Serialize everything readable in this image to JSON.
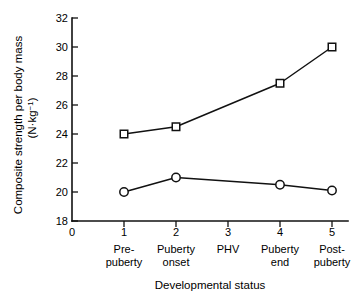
{
  "chart_data": {
    "type": "line",
    "title": "",
    "xlabel": "Developmental status",
    "ylabel": "Composite strength per body mass",
    "ylabel_units": "(N·kg",
    "ylabel_units_sup": "−1",
    "ylabel_units_close": ")",
    "x": [
      1,
      2,
      3,
      4,
      5
    ],
    "categories": [
      "Pre-\npuberty",
      "Puberty\nonset",
      "PHV",
      "Puberty\nend",
      "Post-\npuberty"
    ],
    "category_lines": [
      [
        "Pre-",
        "puberty"
      ],
      [
        "Puberty",
        "onset"
      ],
      [
        "PHV",
        ""
      ],
      [
        "Puberty",
        "end"
      ],
      [
        "Post-",
        "puberty"
      ]
    ],
    "xtick_labels": [
      "0",
      "1",
      "2",
      "3",
      "4",
      "5"
    ],
    "xtick_values": [
      0,
      1,
      2,
      3,
      4,
      5
    ],
    "ytick_labels": [
      "18",
      "20",
      "22",
      "24",
      "26",
      "28",
      "30",
      "32"
    ],
    "ytick_values": [
      18,
      20,
      22,
      24,
      26,
      28,
      30,
      32
    ],
    "xlim": [
      0,
      5.35
    ],
    "ylim": [
      18,
      32
    ],
    "grid": false,
    "legend": "none",
    "series": [
      {
        "name": "Composite strength per body mass (squares)",
        "marker": "open-square",
        "color": "#111111",
        "x": [
          1,
          2,
          4,
          5
        ],
        "values": [
          24.0,
          24.5,
          27.5,
          30.0
        ]
      },
      {
        "name": "Composite strength per body mass (circles)",
        "marker": "open-circle",
        "color": "#111111",
        "x": [
          1,
          2,
          4,
          5
        ],
        "values": [
          20.0,
          21.0,
          20.5,
          20.1
        ]
      }
    ]
  }
}
